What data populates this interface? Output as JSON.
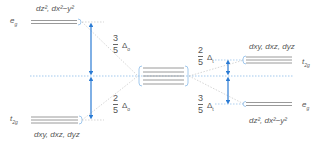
{
  "diagram": {
    "title": "",
    "colors": {
      "level": "#9a9a9a",
      "arrow": "#2a7bd4",
      "dotted_blue": "#8cbbe8",
      "dotted_gray": "#c4c4c4",
      "text": "#555555"
    },
    "octahedral": {
      "eg": {
        "label": "e",
        "sub": "g",
        "orbitals_html": "d<sub>z²</sub>, d<sub>x²−y²</sub>",
        "orbitals": "dz², dx²−y²"
      },
      "t2g": {
        "label": "t",
        "sub": "2g",
        "orbitals": "dxy, dxz, dyz"
      },
      "upper_fraction": {
        "num": "3",
        "den": "5",
        "delta": "Δ",
        "delta_sub": "o"
      },
      "lower_fraction": {
        "num": "2",
        "den": "5",
        "delta": "Δ",
        "delta_sub": "o"
      }
    },
    "free_ion": {
      "levels": 5
    },
    "tetrahedral": {
      "t2g": {
        "label": "t",
        "sub": "2g",
        "orbitals": "dxy, dxz, dyz"
      },
      "eg": {
        "label": "e",
        "sub": "g",
        "orbitals": "dz², dx²−y²"
      },
      "upper_fraction": {
        "num": "2",
        "den": "5",
        "delta": "Δ",
        "delta_sub": "t"
      },
      "lower_fraction": {
        "num": "3",
        "den": "5",
        "delta": "Δ",
        "delta_sub": "t"
      }
    }
  }
}
